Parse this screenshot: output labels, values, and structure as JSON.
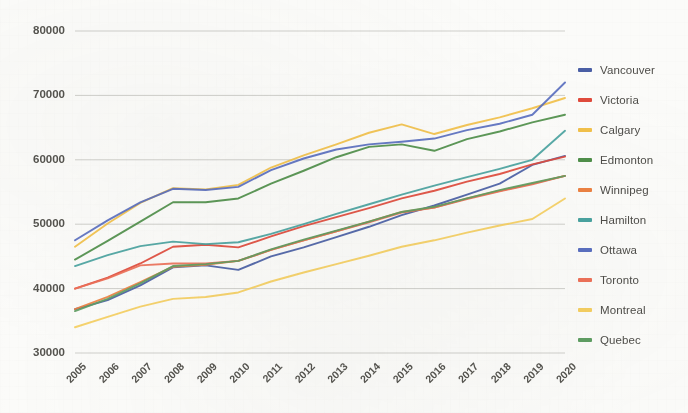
{
  "chart_data": {
    "type": "line",
    "title": "",
    "xlabel": "",
    "ylabel": "",
    "grid": true,
    "legend_position": "right",
    "categories": [
      "2005",
      "2006",
      "2007",
      "2008",
      "2009",
      "2010",
      "2011",
      "2012",
      "2013",
      "2014",
      "2015",
      "2016",
      "2017",
      "2018",
      "2019",
      "2020"
    ],
    "x": [
      2005,
      2006,
      2007,
      2008,
      2009,
      2010,
      2011,
      2012,
      2013,
      2014,
      2015,
      2016,
      2017,
      2018,
      2019,
      2020
    ],
    "ylim": [
      30000,
      80000
    ],
    "yticks": [
      "30000",
      "40000",
      "50000",
      "60000",
      "70000",
      "80000"
    ],
    "ytick_values": [
      30000,
      40000,
      50000,
      60000,
      70000,
      80000
    ],
    "series": [
      {
        "name": "Vancouver",
        "color": "#4a5fa5",
        "values": [
          36800,
          38200,
          40500,
          43300,
          43600,
          42900,
          45000,
          46400,
          48000,
          49600,
          51400,
          52900,
          54600,
          56300,
          59200,
          60600
        ]
      },
      {
        "name": "Victoria",
        "color": "#e04b3c",
        "values": [
          40000,
          41700,
          43900,
          46500,
          46800,
          46400,
          48100,
          49700,
          51100,
          52500,
          54000,
          55200,
          56600,
          57800,
          59300,
          60500
        ]
      },
      {
        "name": "Calgary",
        "color": "#f2c14a",
        "values": [
          46500,
          50100,
          53300,
          55600,
          55400,
          56100,
          58800,
          60700,
          62400,
          64200,
          65500,
          64000,
          65400,
          66600,
          68000,
          69600
        ]
      },
      {
        "name": "Edmonton",
        "color": "#4f8f4a",
        "values": [
          44500,
          47400,
          50400,
          53400,
          53400,
          54000,
          56300,
          58300,
          60400,
          62000,
          62400,
          61400,
          63200,
          64400,
          65800,
          67000
        ]
      },
      {
        "name": "Winnipeg",
        "color": "#ec8242",
        "values": [
          36800,
          38700,
          41000,
          43400,
          43700,
          44300,
          46000,
          47500,
          48900,
          50400,
          51900,
          52600,
          54000,
          55200,
          56300,
          57500
        ]
      },
      {
        "name": "Hamilton",
        "color": "#4aa3a0",
        "values": [
          43500,
          45200,
          46600,
          47300,
          46900,
          47200,
          48500,
          50000,
          51600,
          53100,
          54600,
          56000,
          57300,
          58600,
          60000,
          64500
        ]
      },
      {
        "name": "Ottawa",
        "color": "#5a6fc0",
        "values": [
          47500,
          50600,
          53400,
          55500,
          55300,
          55800,
          58400,
          60200,
          61600,
          62400,
          62800,
          63300,
          64600,
          65600,
          67000,
          72000
        ]
      },
      {
        "name": "Toronto",
        "color": "#ed7159",
        "values": [
          40000,
          41600,
          43600,
          43900,
          43900,
          44300,
          46000,
          47500,
          48900,
          50300,
          51800,
          52600,
          53900,
          55100,
          56200,
          57500
        ]
      },
      {
        "name": "Montreal",
        "color": "#f5cf61",
        "values": [
          34000,
          35600,
          37200,
          38400,
          38700,
          39400,
          41100,
          42500,
          43800,
          45100,
          46500,
          47500,
          48700,
          49800,
          50800,
          54000
        ]
      },
      {
        "name": "Quebec",
        "color": "#5f9e63",
        "values": [
          36500,
          38400,
          40800,
          43500,
          43800,
          44300,
          46100,
          47600,
          49000,
          50400,
          51900,
          52700,
          54000,
          55300,
          56400,
          57500
        ]
      }
    ],
    "legend": [
      {
        "label": "Vancouver",
        "color": "#4a5fa5"
      },
      {
        "label": "Victoria",
        "color": "#e04b3c"
      },
      {
        "label": "Calgary",
        "color": "#f2c14a"
      },
      {
        "label": "Edmonton",
        "color": "#4f8f4a"
      },
      {
        "label": "Winnipeg",
        "color": "#ec8242"
      },
      {
        "label": "Hamilton",
        "color": "#4aa3a0"
      },
      {
        "label": "Ottawa",
        "color": "#5a6fc0"
      },
      {
        "label": "Toronto",
        "color": "#ed7159"
      },
      {
        "label": "Montreal",
        "color": "#f5cf61"
      },
      {
        "label": "Quebec",
        "color": "#5f9e63"
      }
    ]
  },
  "colors": {
    "background": "#fbfbf9",
    "gridline": "#cfcfcb",
    "tick_text": "#55544f",
    "legend_text": "#4e4d49"
  }
}
